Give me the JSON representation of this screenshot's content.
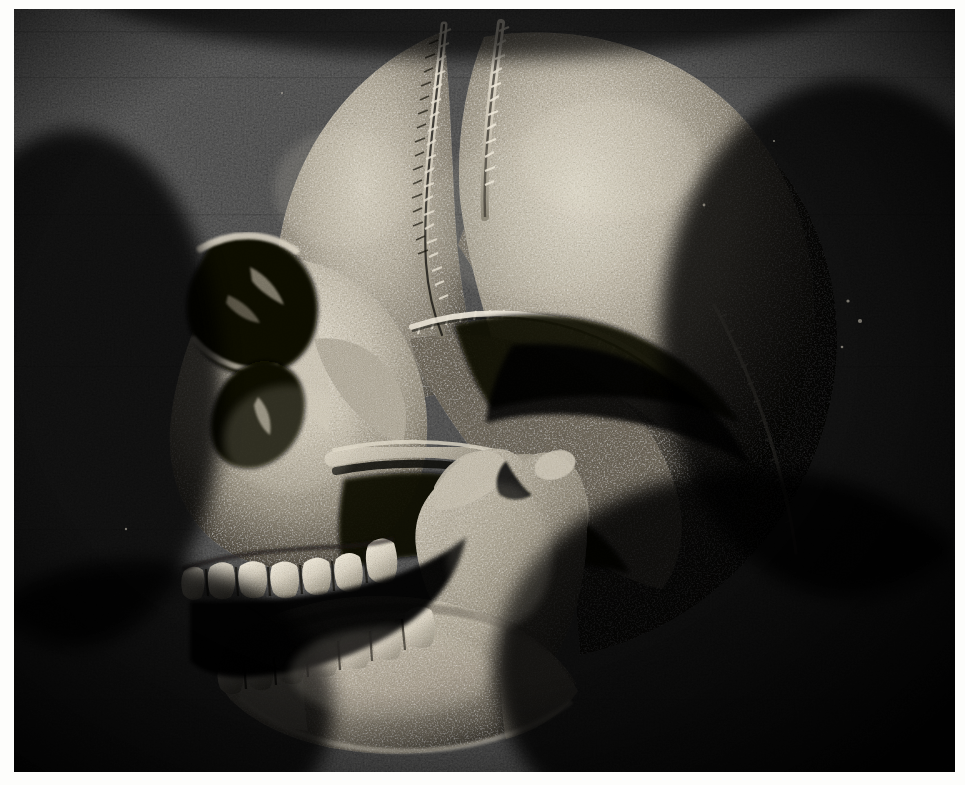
{
  "document": {
    "kind": "photograph",
    "subject": "human skull, left lateral view",
    "medium": "halftone printed black-and-white photograph",
    "orientation": "landscape",
    "background_color": "#080808",
    "bone_highlight_color": "#d8d2c4",
    "bone_midtone_color": "#8e887a",
    "bone_shadow_color": "#2a2722",
    "paper_color": "#fdfdfb",
    "width_px": 965,
    "height_px": 785
  },
  "plate": {
    "margin_left_px": 14,
    "margin_top_px": 9,
    "margin_right_px": 10,
    "margin_bottom_px": 13,
    "image_width_px": 941,
    "image_height_px": 763
  },
  "anatomy": {
    "regions": [
      {
        "id": "cranial-vault",
        "label": "Cranial vault (frontal + parietal)"
      },
      {
        "id": "coronal-suture",
        "label": "Coronal suture"
      },
      {
        "id": "squamosal-suture",
        "label": "Squamosal suture"
      },
      {
        "id": "lambdoid-suture",
        "label": "Lambdoid suture"
      },
      {
        "id": "temporal-bone",
        "label": "Temporal bone / squama"
      },
      {
        "id": "occipital-region",
        "label": "Occipital region"
      },
      {
        "id": "orbit",
        "label": "Orbit (eye socket)"
      },
      {
        "id": "supraorbital-margin",
        "label": "Supraorbital margin"
      },
      {
        "id": "nasal-aperture",
        "label": "Nasal aperture"
      },
      {
        "id": "nasal-bone",
        "label": "Nasal bone"
      },
      {
        "id": "zygomatic-bone",
        "label": "Zygomatic bone"
      },
      {
        "id": "zygomatic-arch",
        "label": "Zygomatic arch"
      },
      {
        "id": "maxilla",
        "label": "Maxilla"
      },
      {
        "id": "maxillary-teeth",
        "label": "Maxillary teeth"
      },
      {
        "id": "mandible",
        "label": "Mandible"
      },
      {
        "id": "mandibular-teeth",
        "label": "Mandibular teeth"
      },
      {
        "id": "mandibular-ramus",
        "label": "Mandibular ramus"
      },
      {
        "id": "coronoid-process",
        "label": "Coronoid process"
      },
      {
        "id": "mandibular-condyle",
        "label": "Mandibular condyle"
      },
      {
        "id": "gonial-angle",
        "label": "Gonial angle"
      },
      {
        "id": "mental-protuberance",
        "label": "Mental protuberance (chin)"
      },
      {
        "id": "external-auditory-meatus",
        "label": "External auditory meatus"
      },
      {
        "id": "mastoid-process",
        "label": "Mastoid process"
      },
      {
        "id": "styloid-process",
        "label": "Styloid process"
      }
    ],
    "teeth": {
      "maxillary_count": 7,
      "mandibular_count": 7,
      "jaw_state": "open"
    }
  }
}
